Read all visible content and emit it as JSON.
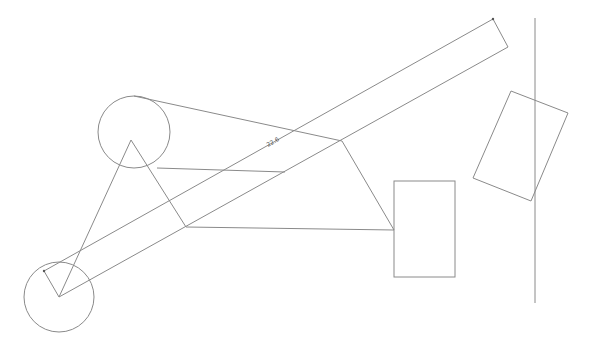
{
  "canvas": {
    "width": 589,
    "height": 347,
    "background": "#ffffff",
    "stroke_color": "#8a8a8a"
  },
  "diagram": {
    "circles": [
      {
        "id": "upper-pulley",
        "cx": 134,
        "cy": 132,
        "r": 36
      },
      {
        "id": "lower-pulley",
        "cx": 59,
        "cy": 297,
        "r": 35
      }
    ],
    "strip": {
      "id": "long-bar",
      "points": [
        [
          44,
          271
        ],
        [
          493,
          19
        ],
        [
          508,
          47
        ],
        [
          59,
          297
        ]
      ],
      "label": "22.6",
      "label_x": 268,
      "label_y": 147,
      "label_angle": -29
    },
    "lines": [
      {
        "id": "belt-top",
        "x1": 134,
        "y1": 96,
        "x2": 342,
        "y2": 141
      },
      {
        "id": "belt-mid",
        "x1": 157,
        "y1": 168,
        "x2": 285,
        "y2": 172
      },
      {
        "id": "triangle-left",
        "x1": 59,
        "y1": 297,
        "x2": 131,
        "y2": 140
      },
      {
        "id": "triangle-right",
        "x1": 131,
        "y1": 140,
        "x2": 186,
        "y2": 227
      },
      {
        "id": "link-bottom",
        "x1": 186,
        "y1": 227,
        "x2": 394,
        "y2": 230
      },
      {
        "id": "link-diagonal",
        "x1": 342,
        "y1": 141,
        "x2": 394,
        "y2": 230
      },
      {
        "id": "vertical-line",
        "x1": 535,
        "y1": 18,
        "x2": 535,
        "y2": 303
      }
    ],
    "rectangles": [
      {
        "id": "block-upright",
        "x": 394,
        "y": 181,
        "width": 61,
        "height": 96
      }
    ],
    "polygons": [
      {
        "id": "block-tilted",
        "points": [
          [
            511,
            91
          ],
          [
            568,
            113
          ],
          [
            531,
            201
          ],
          [
            473,
            178
          ]
        ]
      }
    ],
    "markers": [
      {
        "id": "strip-end-lower",
        "x": 44,
        "y": 271
      },
      {
        "id": "strip-end-upper",
        "x": 493,
        "y": 19
      }
    ]
  }
}
